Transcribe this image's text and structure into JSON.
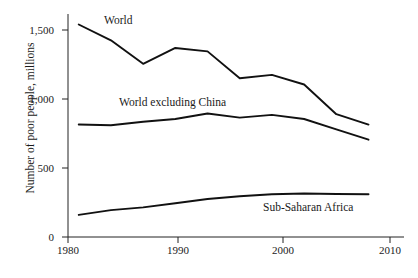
{
  "chart_data": {
    "type": "line",
    "title": "",
    "subtitle": "",
    "xlabel": "",
    "ylabel": "Number of poor people, millions",
    "xlim": [
      1980,
      2010
    ],
    "ylim": [
      0,
      1600
    ],
    "grid": false,
    "legend_position": "inline-annotations",
    "xticks": [
      1980,
      1990,
      2000,
      2010
    ],
    "xtick_labels": [
      "1980",
      "1990",
      "2000",
      "2010"
    ],
    "yticks": [
      0,
      500,
      1000,
      1500
    ],
    "ytick_labels": [
      "0",
      "500",
      "1,000",
      "1,500"
    ],
    "x": [
      1981,
      1984,
      1987,
      1990,
      1993,
      1996,
      1999,
      2002,
      2005,
      2008
    ],
    "series": [
      {
        "name": "World",
        "values": [
          1540,
          1425,
          1255,
          1370,
          1345,
          1150,
          1175,
          1105,
          890,
          815
        ]
      },
      {
        "name": "World excluding China",
        "values": [
          815,
          810,
          835,
          855,
          895,
          865,
          885,
          855,
          780,
          705
        ]
      },
      {
        "name": "Sub-Saharan Africa",
        "values": [
          160,
          195,
          215,
          245,
          275,
          295,
          310,
          315,
          312,
          310
        ]
      }
    ],
    "annotations": [
      {
        "text": "World",
        "x": 1984.5,
        "y": 1500
      },
      {
        "text": "World excluding China",
        "x": 1985.5,
        "y": 985
      },
      {
        "text": "Sub-Saharan Africa",
        "x": 1999.5,
        "y": 250
      }
    ]
  }
}
